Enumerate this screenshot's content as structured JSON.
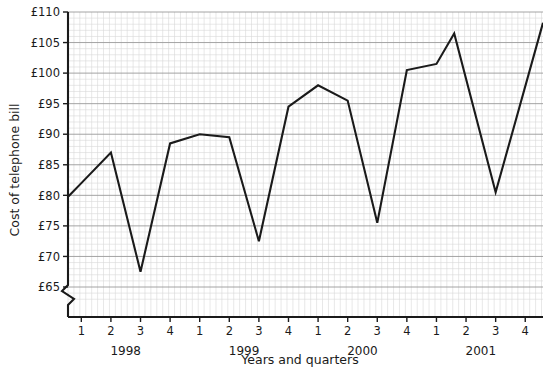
{
  "chart_data": {
    "type": "line",
    "title": "",
    "xlabel": "Years and quarters",
    "ylabel": "Cost of telephone bill",
    "ylim": [
      62.5,
      110
    ],
    "ytick_values": [
      65,
      70,
      75,
      80,
      85,
      90,
      95,
      100,
      105,
      110
    ],
    "ytick_labels": [
      "£65",
      "£70",
      "£75",
      "£80",
      "£85",
      "£90",
      "£95",
      "£100",
      "£105",
      "£110"
    ],
    "y_axis_break": true,
    "grid": true,
    "grid_major_color": "#9a9a9a",
    "grid_minor_color": "#d8d8d8",
    "line_color": "#1a1a1a",
    "legend": "none",
    "categories": [
      "1",
      "2",
      "3",
      "4",
      "1",
      "2",
      "3",
      "4",
      "1",
      "2",
      "3",
      "4",
      "1",
      "2",
      "3",
      "4"
    ],
    "year_groups": [
      {
        "label": "1998",
        "quarters": [
          "1",
          "2",
          "3",
          "4"
        ]
      },
      {
        "label": "1999",
        "quarters": [
          "1",
          "2",
          "3",
          "4"
        ]
      },
      {
        "label": "2000",
        "quarters": [
          "1",
          "2",
          "3",
          "4"
        ]
      },
      {
        "label": "2001",
        "quarters": [
          "1",
          "2",
          "3",
          "4"
        ]
      }
    ],
    "values": [
      82,
      87,
      67.5,
      88.5,
      90,
      89.5,
      72.5,
      94.5,
      98,
      95.5,
      75.5,
      100.5,
      101.5,
      106.5,
      80.5,
      106.5
    ],
    "points": [
      {
        "x": 1,
        "quarter": "1",
        "year": "1998",
        "value": 82
      },
      {
        "x": 2,
        "quarter": "2",
        "year": "1998",
        "value": 87
      },
      {
        "x": 3,
        "quarter": "3",
        "year": "1998",
        "value": 67.5
      },
      {
        "x": 4,
        "quarter": "4",
        "year": "1998",
        "value": 88.5
      },
      {
        "x": 5,
        "quarter": "1",
        "year": "1999",
        "value": 90
      },
      {
        "x": 6,
        "quarter": "2",
        "year": "1999",
        "value": 89.5
      },
      {
        "x": 7,
        "quarter": "3",
        "year": "1999",
        "value": 72.5
      },
      {
        "x": 8,
        "quarter": "4",
        "year": "1999",
        "value": 94.5
      },
      {
        "x": 9,
        "quarter": "1",
        "year": "2000",
        "value": 98
      },
      {
        "x": 10,
        "quarter": "2",
        "year": "2000",
        "value": 95.5
      },
      {
        "x": 11,
        "quarter": "3",
        "year": "2000",
        "value": 75.5
      },
      {
        "x": 12,
        "quarter": "4",
        "year": "2000",
        "value": 100.5
      },
      {
        "x": 13,
        "quarter": "1",
        "year": "2001",
        "value": 101.5
      },
      {
        "x": 13.6,
        "quarter": "1-2",
        "year": "2001",
        "value": 106.5
      },
      {
        "x": 15,
        "quarter": "3",
        "year": "2001",
        "value": 80.5
      },
      {
        "x": 16.5,
        "quarter": "4",
        "year": "2001",
        "value": 106.5
      }
    ],
    "x_axis_start": 0.55,
    "x_axis_end": 16.6
  }
}
